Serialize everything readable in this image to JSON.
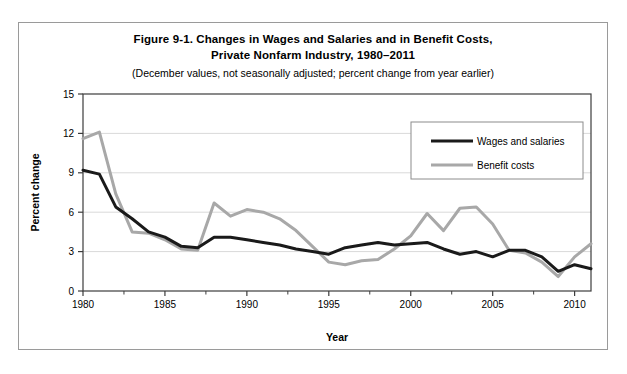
{
  "figure": {
    "title_line1": "Figure 9-1. Changes in Wages and Salaries and in Benefit Costs,",
    "title_line2": "Private Nonfarm Industry, 1980–2011",
    "subtitle": "(December values, not seasonally adjusted; percent change from year earlier)"
  },
  "chart_data": {
    "type": "line",
    "title": "Figure 9-1. Changes in Wages and Salaries and in Benefit Costs, Private Nonfarm Industry, 1980–2011",
    "subtitle": "(December values, not seasonally adjusted; percent change from year earlier)",
    "xlabel": "Year",
    "ylabel": "Percent change",
    "xlim": [
      1980,
      2011
    ],
    "ylim": [
      0,
      15
    ],
    "yticks": [
      0,
      3,
      6,
      9,
      12,
      15
    ],
    "ytick_labels": [
      "0",
      "3",
      "6",
      "9",
      "12",
      "15"
    ],
    "xticks": [
      1980,
      1985,
      1990,
      1995,
      2000,
      2005,
      2010
    ],
    "xtick_labels": [
      "1980",
      "1985",
      "1990",
      "1995",
      "2000",
      "2005",
      "2010"
    ],
    "xminor_interval": 2.5,
    "grid": "horizontal",
    "legend_position": "top-right",
    "x": [
      1980,
      1981,
      1982,
      1983,
      1984,
      1985,
      1986,
      1987,
      1988,
      1989,
      1990,
      1991,
      1992,
      1993,
      1994,
      1995,
      1996,
      1997,
      1998,
      1999,
      2000,
      2001,
      2002,
      2003,
      2004,
      2005,
      2006,
      2007,
      2008,
      2009,
      2010,
      2011
    ],
    "series": [
      {
        "name": "Wages and salaries",
        "color": "#1a1a1a",
        "width": 3.0,
        "values": [
          9.2,
          8.9,
          6.4,
          5.5,
          4.5,
          4.1,
          3.4,
          3.3,
          4.1,
          4.1,
          3.9,
          3.7,
          3.5,
          3.2,
          3.0,
          2.8,
          3.3,
          3.5,
          3.7,
          3.5,
          3.6,
          3.7,
          3.2,
          2.8,
          3.0,
          2.6,
          3.1,
          3.1,
          2.6,
          1.5,
          2.0,
          1.7
        ]
      },
      {
        "name": "Benefit costs",
        "color": "#a8a8a8",
        "width": 3.0,
        "values": [
          11.6,
          12.1,
          7.4,
          4.5,
          4.4,
          3.9,
          3.2,
          3.1,
          6.7,
          5.7,
          6.2,
          6.0,
          5.5,
          4.6,
          3.4,
          2.2,
          2.0,
          2.3,
          2.4,
          3.2,
          4.2,
          5.9,
          4.6,
          6.3,
          6.4,
          5.1,
          3.1,
          2.9,
          2.2,
          1.1,
          2.6,
          3.6
        ]
      }
    ]
  }
}
